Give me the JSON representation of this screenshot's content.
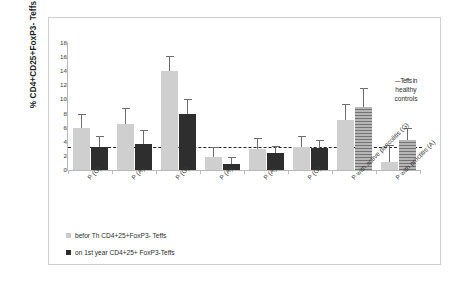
{
  "chart_data": {
    "type": "bar",
    "title": "",
    "xlabel": "",
    "ylabel": "% CD4+CD25+FoxP3- Teffs",
    "ylim": [
      0,
      18
    ],
    "ytick_labels": [
      "0",
      "2",
      "4",
      "6",
      "8",
      "10",
      "12",
      "14",
      "16",
      "18"
    ],
    "ytick_values": [
      0,
      2,
      4,
      6,
      8,
      10,
      12,
      14,
      16,
      18
    ],
    "grid": false,
    "legend_position": "bottom-left",
    "categories": [
      "P (G)",
      "P (A)",
      "P (G)",
      "P (A)",
      "P (A)",
      "P (G)",
      "P with active pancolitis (G)",
      "P with proctitis (A)"
    ],
    "series": [
      {
        "name": "befor Th CD4+25+FoxP3- Teffs",
        "color": "#cfcfcf",
        "values": [
          5.9,
          6.5,
          14.0,
          1.9,
          3.0,
          3.3,
          7.1,
          1.2
        ],
        "errors": [
          2.1,
          2.3,
          2.2,
          1.4,
          1.6,
          1.5,
          2.2,
          2.3
        ]
      },
      {
        "name": "on 1st year CD4+25+ FoxP3-Teffs",
        "color": "#2e2e2e",
        "values": [
          3.2,
          3.7,
          7.9,
          0.9,
          2.4,
          3.1,
          8.9,
          4.2
        ],
        "errors": [
          1.6,
          1.9,
          2.1,
          1.0,
          1.0,
          1.1,
          2.7,
          1.8
        ]
      }
    ],
    "reference_line": {
      "label": "Teffs in healthy controls",
      "value": 3.3,
      "style": "dashed",
      "color": "#222222"
    },
    "annotations": {
      "reference_legend_prefix": "---"
    }
  },
  "legend": {
    "items": [
      {
        "label": "befor Th CD4+25+FoxP3- Teffs",
        "swatch": "light"
      },
      {
        "label": "on 1st year CD4+25+ FoxP3-Teffs",
        "swatch": "dark"
      }
    ]
  },
  "reference_legend": {
    "line1": "---Teffs in",
    "line2": "healthy",
    "line3": "controls"
  }
}
